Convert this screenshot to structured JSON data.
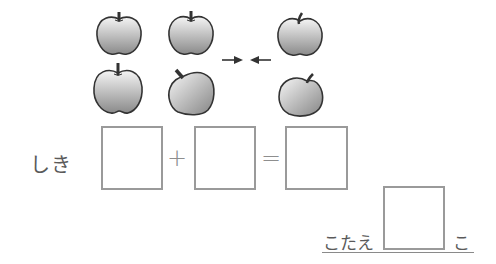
{
  "worksheet": {
    "picture": {
      "left_group_count": 4,
      "right_group_count": 2,
      "item": "apple",
      "arrows": [
        "arrow-right-icon",
        "arrow-left-icon"
      ]
    },
    "equation": {
      "label": "しき",
      "operator_plus": "+",
      "operator_equals": "=",
      "boxes": [
        "",
        "",
        ""
      ]
    },
    "answer": {
      "label": "こたえ",
      "value": "",
      "unit": "こ"
    },
    "colors": {
      "box_border": "#9a9a9a",
      "apple_outline": "#333333",
      "apple_fill_light": "#f2f2f2",
      "apple_fill_dark": "#8c8c8c"
    }
  }
}
